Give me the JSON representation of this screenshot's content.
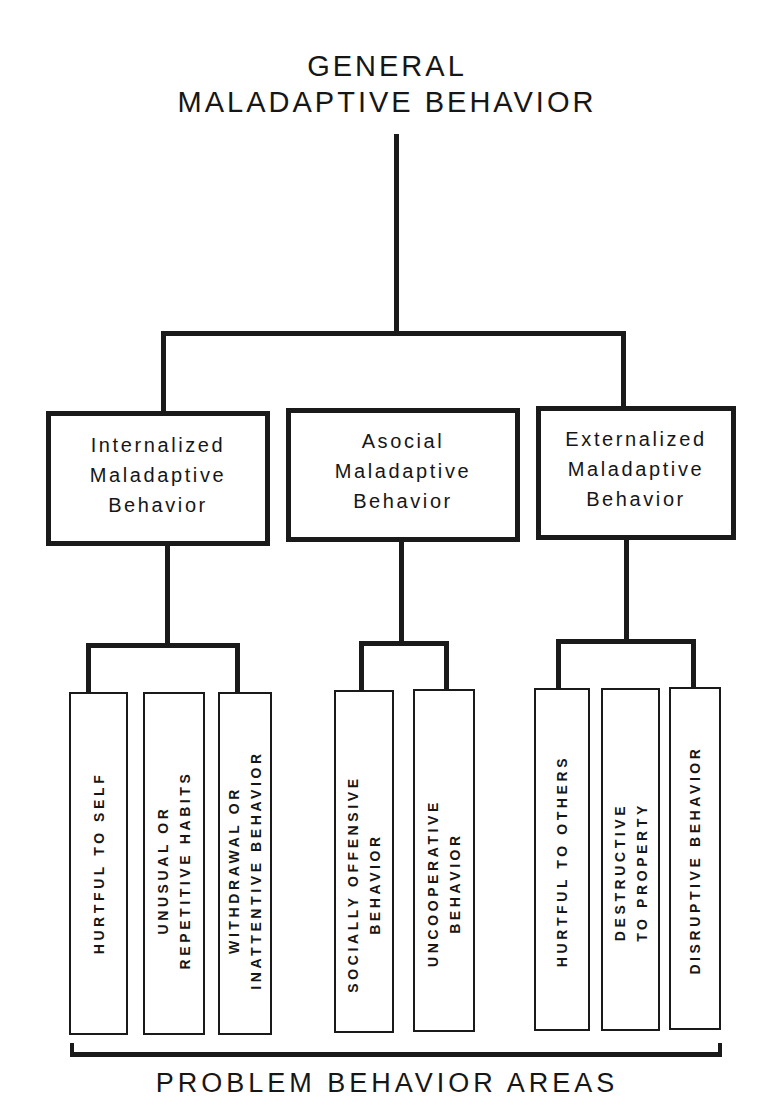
{
  "title": {
    "line1": "GENERAL",
    "line2": "MALADAPTIVE BEHAVIOR"
  },
  "categories": [
    {
      "id": "internalized",
      "lines": [
        "Internalized",
        "Maladaptive",
        "Behavior"
      ],
      "areas": [
        {
          "lines": [
            "HURTFUL TO SELF"
          ]
        },
        {
          "lines": [
            "UNUSUAL OR",
            "REPETITIVE HABITS"
          ]
        },
        {
          "lines": [
            "WITHDRAWAL OR",
            "INATTENTIVE BEHAVIOR"
          ]
        }
      ]
    },
    {
      "id": "asocial",
      "lines": [
        "Asocial",
        "Maladaptive",
        "Behavior"
      ],
      "areas": [
        {
          "lines": [
            "SOCIALLY OFFENSIVE",
            "BEHAVIOR"
          ]
        },
        {
          "lines": [
            "UNCOOPERATIVE",
            "BEHAVIOR"
          ]
        }
      ]
    },
    {
      "id": "externalized",
      "lines": [
        "Externalized",
        "Maladaptive",
        "Behavior"
      ],
      "areas": [
        {
          "lines": [
            "HURTFUL TO OTHERS"
          ]
        },
        {
          "lines": [
            "DESTRUCTIVE",
            "TO PROPERTY"
          ]
        },
        {
          "lines": [
            "DISRUPTIVE BEHAVIOR"
          ]
        }
      ]
    }
  ],
  "footer": {
    "label": "PROBLEM BEHAVIOR AREAS"
  },
  "colors": {
    "ink": "#1a1a1a",
    "background": "#ffffff"
  }
}
